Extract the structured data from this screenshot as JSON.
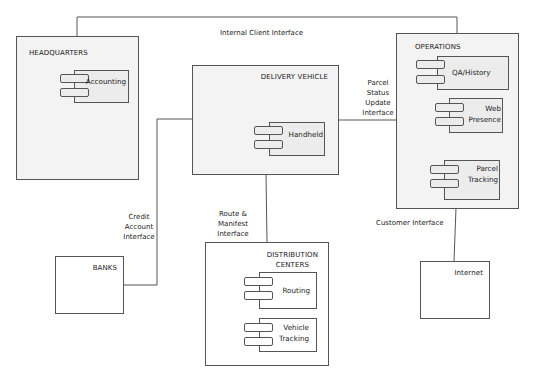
{
  "diagram": {
    "type": "component-deployment",
    "nodes": [
      {
        "id": "headquarters",
        "title": "HEADQUARTERS",
        "components": [
          "Accounting"
        ]
      },
      {
        "id": "delivery_vehicle",
        "title": "DELIVERY VEHICLE",
        "components": [
          "Handheld"
        ]
      },
      {
        "id": "operations",
        "title": "OPERATIONS",
        "components": [
          "QA/History",
          "Web Presence",
          "Parcel Tracking"
        ]
      },
      {
        "id": "banks",
        "title": "BANKS",
        "components": []
      },
      {
        "id": "distribution_centers",
        "title": "DISTRIBUTION CENTERS",
        "components": [
          "Routing",
          "Vehicle Tracking"
        ]
      },
      {
        "id": "internet",
        "title": "Internet",
        "components": []
      }
    ],
    "edges": [
      {
        "from": "headquarters",
        "to": "operations",
        "label": "Internal Client Interface"
      },
      {
        "from": "delivery_vehicle",
        "to": "operations",
        "label": "Parcel Status Update Interface"
      },
      {
        "from": "delivery_vehicle",
        "to": "banks",
        "label": "Credit Account Interface"
      },
      {
        "from": "delivery_vehicle",
        "to": "distribution_centers",
        "label": "Route & Manifest Interface"
      },
      {
        "from": "operations",
        "to": "internet",
        "label": "Customer Interface"
      }
    ]
  },
  "labels": {
    "hq_title": "HEADQUARTERS",
    "accounting": "Accounting",
    "dv_title": "DELIVERY VEHICLE",
    "handheld": "Handheld",
    "ops_title": "OPERATIONS",
    "qa_history": "QA/History",
    "web_presence_1": "Web",
    "web_presence_2": "Presence",
    "parcel_tracking_1": "Parcel",
    "parcel_tracking_2": "Tracking",
    "banks_title": "BANKS",
    "dc_title_1": "DISTRIBUTION",
    "dc_title_2": "CENTERS",
    "routing": "Routing",
    "vehicle_tracking_1": "Vehicle",
    "vehicle_tracking_2": "Tracking",
    "internet_title": "Internet",
    "edge_internal_client": "Internal Client Interface",
    "edge_parcel_status_1": "Parcel",
    "edge_parcel_status_2": "Status",
    "edge_parcel_status_3": "Update",
    "edge_parcel_status_4": "Interface",
    "edge_credit_1": "Credit",
    "edge_credit_2": "Account",
    "edge_credit_3": "Interface",
    "edge_route_1": "Route &",
    "edge_route_2": "Manifest",
    "edge_route_3": "Interface",
    "edge_customer": "Customer Interface"
  }
}
